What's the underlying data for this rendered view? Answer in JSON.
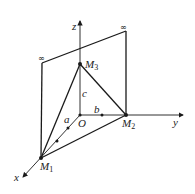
{
  "diagram": {
    "type": "3d-coordinate-plane-intercepts",
    "axes": {
      "x": "x",
      "y": "y",
      "z": "z",
      "origin": "O"
    },
    "points": {
      "M1": {
        "label": "M",
        "sub": "1"
      },
      "M2": {
        "label": "M",
        "sub": "2"
      },
      "M3": {
        "label": "M",
        "sub": "3"
      }
    },
    "segments": {
      "a": "a",
      "b": "b",
      "c": "c"
    },
    "infinity_marks": [
      "∞",
      "∞"
    ],
    "colors": {
      "line": "#1a1a1a",
      "background": "#ffffff"
    }
  }
}
